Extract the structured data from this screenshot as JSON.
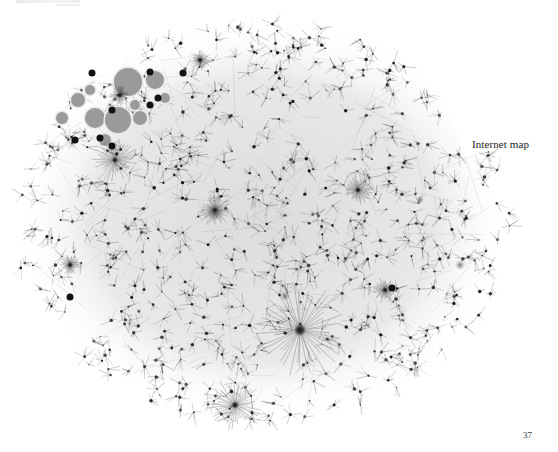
{
  "figure": {
    "caption": "Internet map"
  },
  "page": {
    "number": "37"
  },
  "colors": {
    "background": "#ffffff",
    "ink": "#1a1a1a",
    "cluster_fill": "#9a9a9a"
  }
}
